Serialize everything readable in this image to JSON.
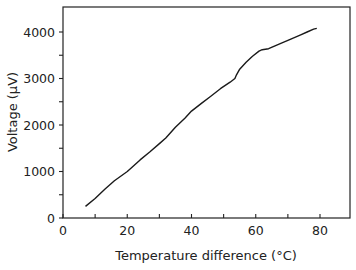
{
  "chart_data": {
    "type": "line",
    "title": "",
    "xlabel": "Temperature difference (°C)",
    "ylabel": "Voltage (µV)",
    "xlim": [
      0,
      90
    ],
    "ylim": [
      0,
      4500
    ],
    "xticks": [
      0,
      20,
      40,
      60,
      80
    ],
    "xticks_minor": [
      10,
      30,
      50,
      70
    ],
    "yticks": [
      0,
      1000,
      2000,
      3000,
      4000
    ],
    "yticks_minor": [
      500,
      1500,
      2500,
      3500
    ],
    "grid": false,
    "legend": null,
    "series": [
      {
        "name": "Voltage",
        "color": "#1a1a1a",
        "x": [
          7,
          10,
          13,
          16,
          20,
          24,
          27,
          30,
          32,
          35,
          38,
          40,
          43,
          46,
          49,
          52,
          53.5,
          54,
          55,
          57,
          59,
          61,
          62,
          64,
          66,
          68,
          70,
          72,
          74,
          76,
          78,
          79
        ],
        "y": [
          250,
          420,
          620,
          800,
          1000,
          1250,
          1420,
          1600,
          1720,
          1950,
          2150,
          2300,
          2460,
          2620,
          2780,
          2920,
          3000,
          3080,
          3200,
          3350,
          3480,
          3590,
          3620,
          3640,
          3700,
          3760,
          3820,
          3880,
          3940,
          4000,
          4060,
          4080
        ]
      }
    ]
  },
  "labels": {
    "xlabel": "Temperature difference (°C)",
    "ylabel": "Voltage (µV)",
    "xticks": [
      "0",
      "20",
      "40",
      "60",
      "80"
    ],
    "yticks": [
      "0",
      "1000",
      "2000",
      "3000",
      "4000"
    ]
  }
}
